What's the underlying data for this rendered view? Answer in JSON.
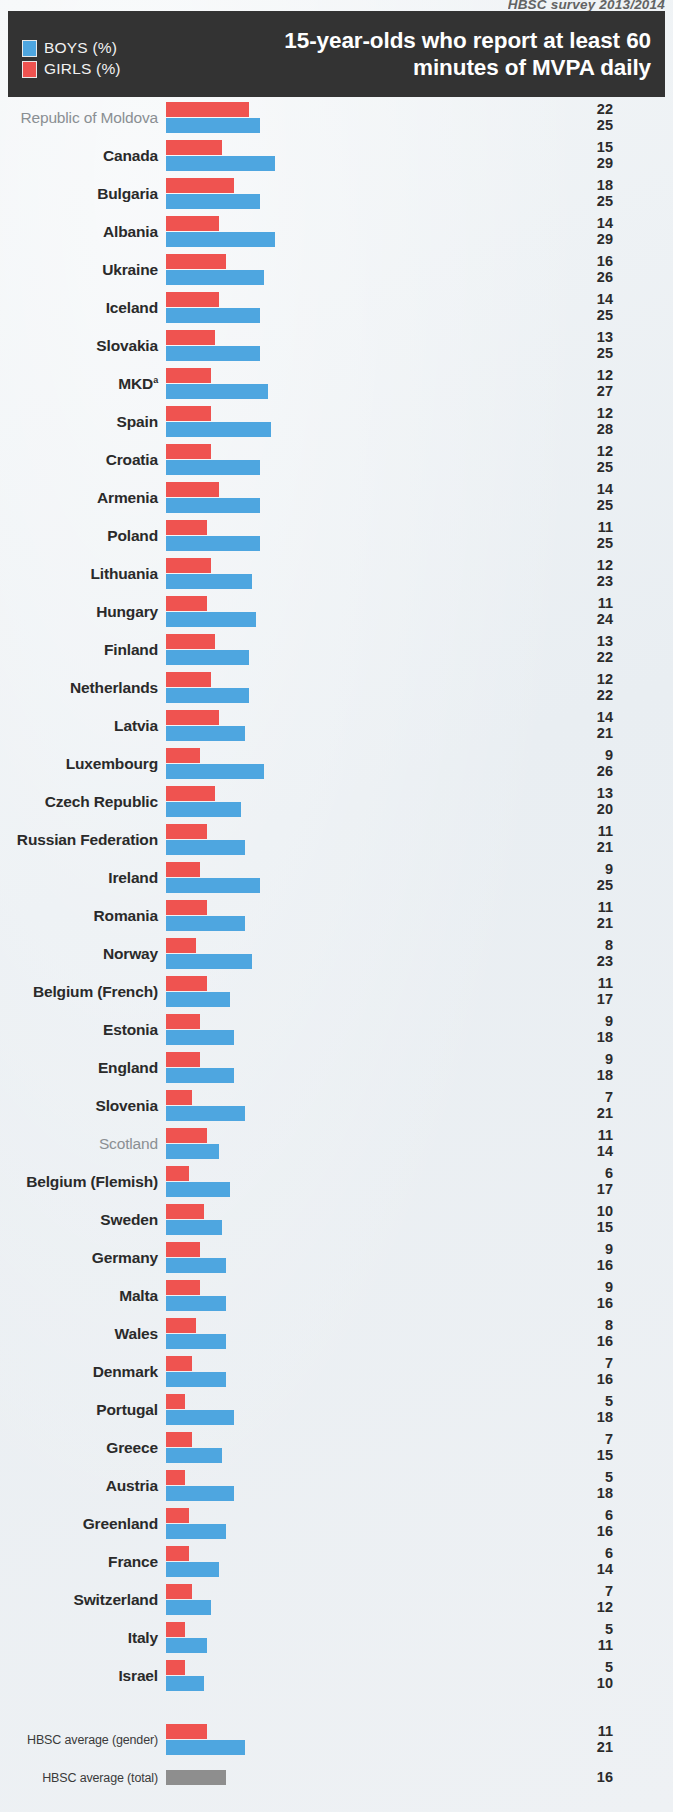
{
  "source_note": "HBSC survey 2013/2014",
  "header": {
    "title": "15-year-olds who report at least 60 minutes of MVPA daily",
    "legend": [
      {
        "label": "BOYS (%)",
        "color": "#4ea6e0",
        "key": "boys"
      },
      {
        "label": "GIRLS (%)",
        "color": "#ef5350",
        "key": "girls"
      }
    ]
  },
  "chart_data": {
    "type": "bar",
    "orientation": "horizontal",
    "title": "15-year-olds who report at least 60 minutes of MVPA daily",
    "subtitle": "HBSC survey 2013/2014",
    "xlabel": "",
    "ylabel": "",
    "xlim": [
      0,
      30
    ],
    "grid": false,
    "legend_position": "top-left",
    "series": [
      {
        "name": "GIRLS (%)",
        "color": "#ef5350"
      },
      {
        "name": "BOYS (%)",
        "color": "#4ea6e0"
      }
    ],
    "categories": [
      "Republic of Moldova",
      "Canada",
      "Bulgaria",
      "Albania",
      "Ukraine",
      "Iceland",
      "Slovakia",
      "MKD",
      "Spain",
      "Croatia",
      "Armenia",
      "Poland",
      "Lithuania",
      "Hungary",
      "Finland",
      "Netherlands",
      "Latvia",
      "Luxembourg",
      "Czech Republic",
      "Russian Federation",
      "Ireland",
      "Romania",
      "Norway",
      "Belgium (French)",
      "Estonia",
      "England",
      "Slovenia",
      "Scotland",
      "Belgium (Flemish)",
      "Sweden",
      "Germany",
      "Malta",
      "Wales",
      "Denmark",
      "Portugal",
      "Greece",
      "Austria",
      "Greenland",
      "France",
      "Switzerland",
      "Italy",
      "Israel"
    ],
    "girls": [
      22,
      15,
      18,
      14,
      16,
      14,
      13,
      12,
      12,
      12,
      14,
      11,
      12,
      11,
      13,
      12,
      14,
      9,
      13,
      11,
      9,
      11,
      8,
      11,
      9,
      9,
      7,
      11,
      6,
      10,
      9,
      9,
      8,
      7,
      5,
      7,
      5,
      6,
      6,
      7,
      5,
      5
    ],
    "boys": [
      25,
      29,
      25,
      29,
      26,
      25,
      25,
      27,
      28,
      25,
      25,
      25,
      23,
      24,
      22,
      22,
      21,
      26,
      20,
      21,
      25,
      21,
      23,
      17,
      18,
      18,
      21,
      14,
      17,
      15,
      16,
      16,
      16,
      16,
      18,
      15,
      18,
      16,
      14,
      12,
      11,
      10
    ],
    "averages": [
      {
        "label": "HBSC average (gender)",
        "girls": 11,
        "boys": 21
      },
      {
        "label": "HBSC average (total)",
        "total": 16
      }
    ]
  },
  "rows": [
    {
      "name": "Republic of Moldova",
      "girls": 22,
      "boys": 25,
      "muted": true,
      "sup": ""
    },
    {
      "name": "Canada",
      "girls": 15,
      "boys": 29,
      "muted": false,
      "sup": ""
    },
    {
      "name": "Bulgaria",
      "girls": 18,
      "boys": 25,
      "muted": false,
      "sup": ""
    },
    {
      "name": "Albania",
      "girls": 14,
      "boys": 29,
      "muted": false,
      "sup": ""
    },
    {
      "name": "Ukraine",
      "girls": 16,
      "boys": 26,
      "muted": false,
      "sup": ""
    },
    {
      "name": "Iceland",
      "girls": 14,
      "boys": 25,
      "muted": false,
      "sup": ""
    },
    {
      "name": "Slovakia",
      "girls": 13,
      "boys": 25,
      "muted": false,
      "sup": ""
    },
    {
      "name": "MKD",
      "girls": 12,
      "boys": 27,
      "muted": false,
      "sup": "a"
    },
    {
      "name": "Spain",
      "girls": 12,
      "boys": 28,
      "muted": false,
      "sup": ""
    },
    {
      "name": "Croatia",
      "girls": 12,
      "boys": 25,
      "muted": false,
      "sup": ""
    },
    {
      "name": "Armenia",
      "girls": 14,
      "boys": 25,
      "muted": false,
      "sup": ""
    },
    {
      "name": "Poland",
      "girls": 11,
      "boys": 25,
      "muted": false,
      "sup": ""
    },
    {
      "name": "Lithuania",
      "girls": 12,
      "boys": 23,
      "muted": false,
      "sup": ""
    },
    {
      "name": "Hungary",
      "girls": 11,
      "boys": 24,
      "muted": false,
      "sup": ""
    },
    {
      "name": "Finland",
      "girls": 13,
      "boys": 22,
      "muted": false,
      "sup": ""
    },
    {
      "name": "Netherlands",
      "girls": 12,
      "boys": 22,
      "muted": false,
      "sup": ""
    },
    {
      "name": "Latvia",
      "girls": 14,
      "boys": 21,
      "muted": false,
      "sup": ""
    },
    {
      "name": "Luxembourg",
      "girls": 9,
      "boys": 26,
      "muted": false,
      "sup": ""
    },
    {
      "name": "Czech Republic",
      "girls": 13,
      "boys": 20,
      "muted": false,
      "sup": ""
    },
    {
      "name": "Russian Federation",
      "girls": 11,
      "boys": 21,
      "muted": false,
      "sup": ""
    },
    {
      "name": "Ireland",
      "girls": 9,
      "boys": 25,
      "muted": false,
      "sup": ""
    },
    {
      "name": "Romania",
      "girls": 11,
      "boys": 21,
      "muted": false,
      "sup": ""
    },
    {
      "name": "Norway",
      "girls": 8,
      "boys": 23,
      "muted": false,
      "sup": ""
    },
    {
      "name": "Belgium (French)",
      "girls": 11,
      "boys": 17,
      "muted": false,
      "sup": ""
    },
    {
      "name": "Estonia",
      "girls": 9,
      "boys": 18,
      "muted": false,
      "sup": ""
    },
    {
      "name": "England",
      "girls": 9,
      "boys": 18,
      "muted": false,
      "sup": ""
    },
    {
      "name": "Slovenia",
      "girls": 7,
      "boys": 21,
      "muted": false,
      "sup": ""
    },
    {
      "name": "Scotland",
      "girls": 11,
      "boys": 14,
      "muted": true,
      "sup": ""
    },
    {
      "name": "Belgium (Flemish)",
      "girls": 6,
      "boys": 17,
      "muted": false,
      "sup": ""
    },
    {
      "name": "Sweden",
      "girls": 10,
      "boys": 15,
      "muted": false,
      "sup": ""
    },
    {
      "name": "Germany",
      "girls": 9,
      "boys": 16,
      "muted": false,
      "sup": ""
    },
    {
      "name": "Malta",
      "girls": 9,
      "boys": 16,
      "muted": false,
      "sup": ""
    },
    {
      "name": "Wales",
      "girls": 8,
      "boys": 16,
      "muted": false,
      "sup": ""
    },
    {
      "name": "Denmark",
      "girls": 7,
      "boys": 16,
      "muted": false,
      "sup": ""
    },
    {
      "name": "Portugal",
      "girls": 5,
      "boys": 18,
      "muted": false,
      "sup": ""
    },
    {
      "name": "Greece",
      "girls": 7,
      "boys": 15,
      "muted": false,
      "sup": ""
    },
    {
      "name": "Austria",
      "girls": 5,
      "boys": 18,
      "muted": false,
      "sup": ""
    },
    {
      "name": "Greenland",
      "girls": 6,
      "boys": 16,
      "muted": false,
      "sup": ""
    },
    {
      "name": "France",
      "girls": 6,
      "boys": 14,
      "muted": false,
      "sup": ""
    },
    {
      "name": "Switzerland",
      "girls": 7,
      "boys": 12,
      "muted": false,
      "sup": ""
    },
    {
      "name": "Italy",
      "girls": 5,
      "boys": 11,
      "muted": false,
      "sup": ""
    },
    {
      "name": "Israel",
      "girls": 5,
      "boys": 10,
      "muted": false,
      "sup": ""
    }
  ],
  "average_rows": [
    {
      "name": "HBSC average (gender)",
      "girls": 11,
      "boys": 21,
      "total": null
    },
    {
      "name": "HBSC average (total)",
      "girls": null,
      "boys": null,
      "total": 16
    }
  ],
  "scale": {
    "px_per_unit": 3.76
  }
}
